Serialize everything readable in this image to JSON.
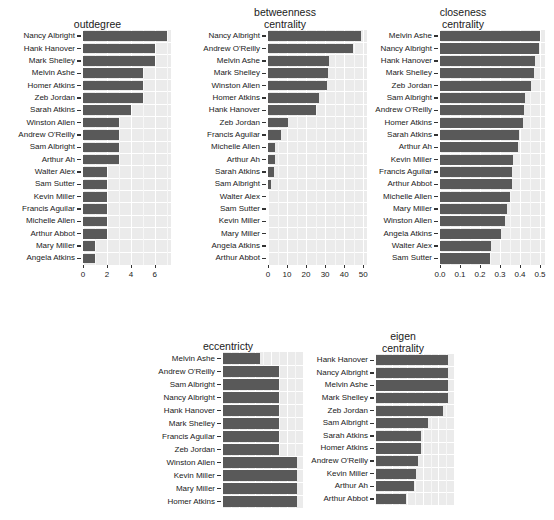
{
  "chart_data": [
    {
      "type": "bar",
      "orientation": "horizontal",
      "title": "outdegree",
      "xlabel": "",
      "ylabel": "",
      "xlim": [
        0,
        7.35
      ],
      "xticks": [
        0,
        2,
        4,
        6
      ],
      "xticklabels": [
        "0",
        "2",
        "4",
        "6"
      ],
      "grid": true,
      "categories": [
        "Nancy Albright",
        "Hank Hanover",
        "Mark Shelley",
        "Melvin Ashe",
        "Homer Atkins",
        "Zeb Jordan",
        "Sarah Atkins",
        "Winston Allen",
        "Andrew O'Reilly",
        "Sam Albright",
        "Arthur Ah",
        "Walter Alex",
        "Sam Sutter",
        "Kevin Miller",
        "Francis Aguilar",
        "Michelle Allen",
        "Arthur Abbot",
        "Mary Miller",
        "Angela Atkins"
      ],
      "values": [
        7,
        6,
        6,
        5,
        5,
        5,
        4,
        3,
        3,
        3,
        3,
        2,
        2,
        2,
        2,
        2,
        2,
        1,
        1
      ]
    },
    {
      "type": "bar",
      "orientation": "horizontal",
      "title": "betweenness\ncentrality",
      "xlabel": "",
      "ylabel": "",
      "xlim": [
        0,
        52
      ],
      "xticks": [
        0,
        10,
        20,
        30,
        40,
        50
      ],
      "xticklabels": [
        "0",
        "10",
        "20",
        "30",
        "40",
        "50"
      ],
      "grid": true,
      "categories": [
        "Nancy Albright",
        "Andrew O'Reilly",
        "Melvin Ashe",
        "Mark Shelley",
        "Winston Allen",
        "Homer Atkins",
        "Hank Hanover",
        "Zeb Jordan",
        "Francis Aguilar",
        "Michelle Allen",
        "Arthur Ah",
        "Sarah Atkins",
        "Sam Albright",
        "Walter Alex",
        "Sam Sutter",
        "Kevin Miller",
        "Mary Miller",
        "Angela Atkins",
        "Arthur Abbot"
      ],
      "values": [
        49,
        44.5,
        32,
        31.5,
        31,
        27,
        25,
        10.5,
        7,
        3.5,
        3.5,
        3,
        1.5,
        0,
        0,
        0,
        0,
        0,
        0
      ]
    },
    {
      "type": "bar",
      "orientation": "horizontal",
      "title": "closeness\ncentrality",
      "xlabel": "",
      "ylabel": "",
      "xlim": [
        0,
        0.525
      ],
      "xticks": [
        0.0,
        0.1,
        0.2,
        0.3,
        0.4,
        0.5
      ],
      "xticklabels": [
        "0.0",
        "0.1",
        "0.2",
        "0.3",
        "0.4",
        "0.5"
      ],
      "grid": true,
      "categories": [
        "Melvin Ashe",
        "Nancy Albright",
        "Hank Hanover",
        "Mark Shelley",
        "Zeb Jordan",
        "Sam Albright",
        "Andrew O'Reilly",
        "Homer Atkins",
        "Sarah Atkins",
        "Arthur Ah",
        "Kevin Miller",
        "Francis Aguilar",
        "Arthur Abbot",
        "Michelle Allen",
        "Mary Miller",
        "Winston Allen",
        "Angela Atkins",
        "Walter Alex",
        "Sam Sutter"
      ],
      "values": [
        0.5,
        0.495,
        0.475,
        0.472,
        0.455,
        0.425,
        0.418,
        0.415,
        0.395,
        0.39,
        0.365,
        0.362,
        0.358,
        0.352,
        0.335,
        0.325,
        0.305,
        0.255,
        0.252
      ]
    },
    {
      "type": "bar",
      "orientation": "horizontal",
      "title": "eccentricty",
      "xlabel": "",
      "ylabel": "",
      "xlim": [
        0,
        4.3
      ],
      "xticks": [],
      "xticklabels": [],
      "grid": true,
      "clipped": true,
      "categories": [
        "Melvin Ashe",
        "Andrew O'Reilly",
        "Sam Albright",
        "Nancy Albright",
        "Hank Hanover",
        "Mark Shelley",
        "Francis Aguilar",
        "Zeb Jordan",
        "Winston Allen",
        "Kevin Miller",
        "Mary Miller",
        "Homer Atkins"
      ],
      "values": [
        2.0,
        3.0,
        3.0,
        3.0,
        3.0,
        3.0,
        3.0,
        3.0,
        4.0,
        4.0,
        4.0,
        4.0
      ]
    },
    {
      "type": "bar",
      "orientation": "horizontal",
      "title": "eigen\ncentrality",
      "xlabel": "",
      "ylabel": "",
      "xlim": [
        0,
        1.08
      ],
      "xticks": [],
      "xticklabels": [],
      "grid": true,
      "clipped": true,
      "categories": [
        "Hank Hanover",
        "Nancy Albright",
        "Melvin Ashe",
        "Mark Shelley",
        "Zeb Jordan",
        "Sam Albright",
        "Sarah Atkins",
        "Homer Atkins",
        "Andrew O'Reilly",
        "Kevin Miller",
        "Arthur Ah",
        "Arthur Abbot"
      ],
      "values": [
        1.0,
        1.0,
        1.0,
        0.99,
        0.93,
        0.72,
        0.62,
        0.62,
        0.58,
        0.56,
        0.52,
        0.41
      ]
    }
  ],
  "figure": {
    "bar_color": "#595959",
    "panel_background": "#ebebeb",
    "grid_color": "#ffffff",
    "text_color": "#1a1a1a"
  }
}
